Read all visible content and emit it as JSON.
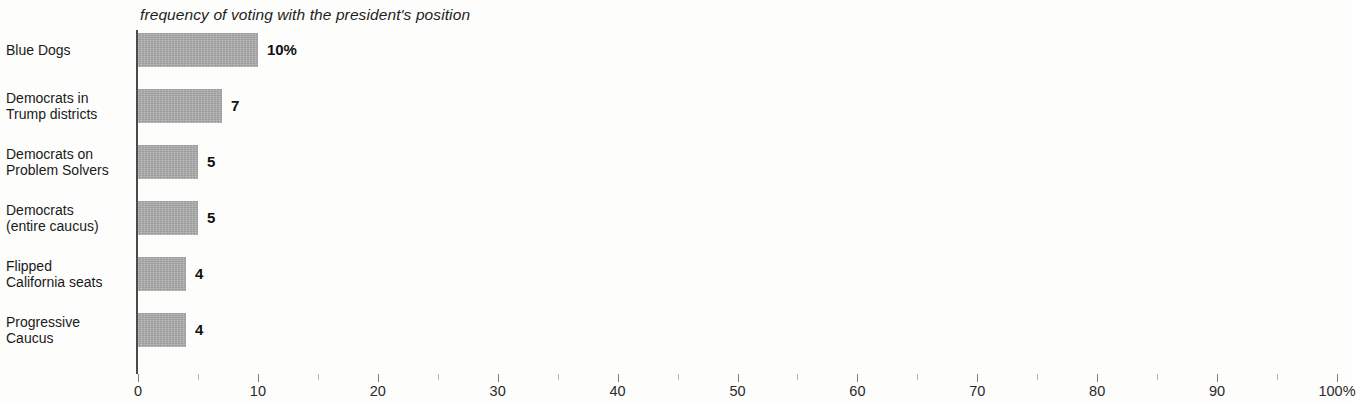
{
  "chart_data": {
    "type": "bar",
    "orientation": "horizontal",
    "title": "frequency of voting with the president's position",
    "xlabel": "",
    "ylabel": "",
    "xlim": [
      0,
      100
    ],
    "grid": false,
    "legend": null,
    "unit_suffix": "%",
    "categories": [
      "Blue Dogs",
      "Democrats in Trump districts",
      "Democrats on Problem Solvers",
      "Democrats (entire caucus)",
      "Flipped California seats",
      "Progressive Caucus"
    ],
    "category_lines": [
      [
        "Blue Dogs"
      ],
      [
        "Democrats in",
        "Trump districts"
      ],
      [
        "Democrats on",
        "Problem Solvers"
      ],
      [
        "Democrats",
        "(entire caucus)"
      ],
      [
        "Flipped",
        "California seats"
      ],
      [
        "Progressive",
        "Caucus"
      ]
    ],
    "values": [
      10,
      7,
      5,
      5,
      4,
      4
    ],
    "data_labels": [
      "10%",
      "7",
      "5",
      "5",
      "4",
      "4"
    ],
    "x_ticks_major": [
      0,
      10,
      20,
      30,
      40,
      50,
      60,
      70,
      80,
      90,
      100
    ],
    "x_tick_labels": [
      "0",
      "10",
      "20",
      "30",
      "40",
      "50",
      "60",
      "70",
      "80",
      "90",
      "100%"
    ],
    "x_ticks_minor": [
      5,
      15,
      25,
      35,
      45,
      55,
      65,
      75,
      85,
      95
    ],
    "colors": {
      "bar": "#a9a9a9",
      "axis": "#4a4a4a",
      "text": "#1a1a1a",
      "background": "#fdfdfc",
      "tick_major": "#7d7d7d",
      "tick_minor": "#b4b4b4"
    }
  }
}
